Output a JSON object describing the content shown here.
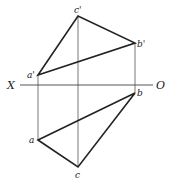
{
  "diagram": {
    "type": "orthographic-projection",
    "axis": {
      "left_label": "X",
      "right_label": "O"
    },
    "points": {
      "a_prime": {
        "label": "a'"
      },
      "b_prime": {
        "label": "b'"
      },
      "c_prime": {
        "label": "c'"
      },
      "a": {
        "label": "a"
      },
      "b": {
        "label": "b"
      },
      "c": {
        "label": "c"
      }
    },
    "colors": {
      "line": "#222222",
      "projector": "#555555",
      "background": "#ffffff"
    }
  }
}
